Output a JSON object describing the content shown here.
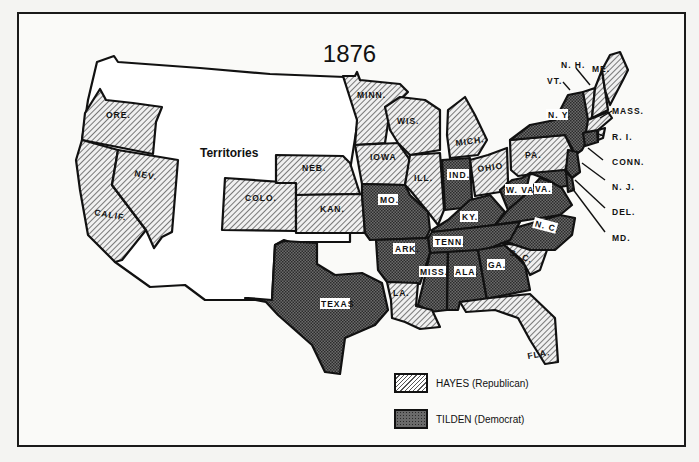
{
  "map": {
    "title": "1876",
    "territories_label": "Territories",
    "colors": {
      "hayes_fill": "#d8d8d8",
      "tilden_fill": "#555555",
      "outline": "#111111",
      "background": "#fafaf8"
    },
    "states": {
      "ore": "ORE.",
      "calif": "CALIF.",
      "nev": "NEV.",
      "colo": "COLO.",
      "neb": "NEB.",
      "kan": "KAN.",
      "minn": "MINN.",
      "iowa": "IOWA",
      "wis": "WIS.",
      "mich": "MICH.",
      "ill": "ILL.",
      "ind": "IND.",
      "ohio": "OHIO",
      "pa": "PA.",
      "ny": "N. Y.",
      "mo": "MO.",
      "ky": "KY.",
      "wva": "W. VA.",
      "va": "VA.",
      "nc": "N. C.",
      "tenn": "TENN.",
      "ark": "ARK.",
      "sc": "S. C.",
      "texas": "TEXAS",
      "la": "LA.",
      "miss": "MISS.",
      "ala": "ALA.",
      "ga": "GA.",
      "fla": "FLA.",
      "nh": "N. H.",
      "vt": "VT.",
      "me": "ME.",
      "mass": "MASS.",
      "ri": "R. I.",
      "conn": "CONN.",
      "nj": "N. J.",
      "del": "DEL.",
      "md": "MD."
    }
  },
  "legend": {
    "items": [
      {
        "label": "HAYES  (Republican)",
        "pattern": "hatched"
      },
      {
        "label": "TILDEN  (Democrat)",
        "pattern": "crosshatched"
      }
    ]
  },
  "results": {
    "hayes_republican": [
      "ORE.",
      "CALIF.",
      "NEV.",
      "COLO.",
      "NEB.",
      "KAN.",
      "MINN.",
      "IOWA",
      "WIS.",
      "MICH.",
      "ILL.",
      "OHIO",
      "PA.",
      "S. C.",
      "LA.",
      "FLA.",
      "VT.",
      "N. H.",
      "ME.",
      "MASS.",
      "R. I."
    ],
    "tilden_democrat": [
      "N. Y.",
      "CONN.",
      "N. J.",
      "DEL.",
      "MD.",
      "IND.",
      "MO.",
      "KY.",
      "W. VA.",
      "VA.",
      "N. C.",
      "TENN.",
      "ARK.",
      "TEXAS",
      "MISS.",
      "ALA.",
      "GA."
    ]
  }
}
